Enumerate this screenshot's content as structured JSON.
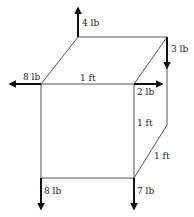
{
  "diagram": {
    "type": "cube-force-diagram",
    "forces": [
      {
        "id": "f4",
        "label": "4 lb",
        "direction": "up"
      },
      {
        "id": "f3",
        "label": "3 lb",
        "direction": "down"
      },
      {
        "id": "f8a",
        "label": "8 lb",
        "direction": "left"
      },
      {
        "id": "f2",
        "label": "2 lb",
        "direction": "right"
      },
      {
        "id": "f8b",
        "label": "8 lb",
        "direction": "down"
      },
      {
        "id": "f7",
        "label": "7 lb",
        "direction": "down"
      }
    ],
    "dimensions": [
      {
        "id": "width",
        "label": "1 ft"
      },
      {
        "id": "height",
        "label": "1 ft"
      },
      {
        "id": "depth",
        "label": "1 ft"
      }
    ],
    "colors": {
      "edges": "#555555",
      "forces": "#111111",
      "text": "#222222"
    }
  }
}
